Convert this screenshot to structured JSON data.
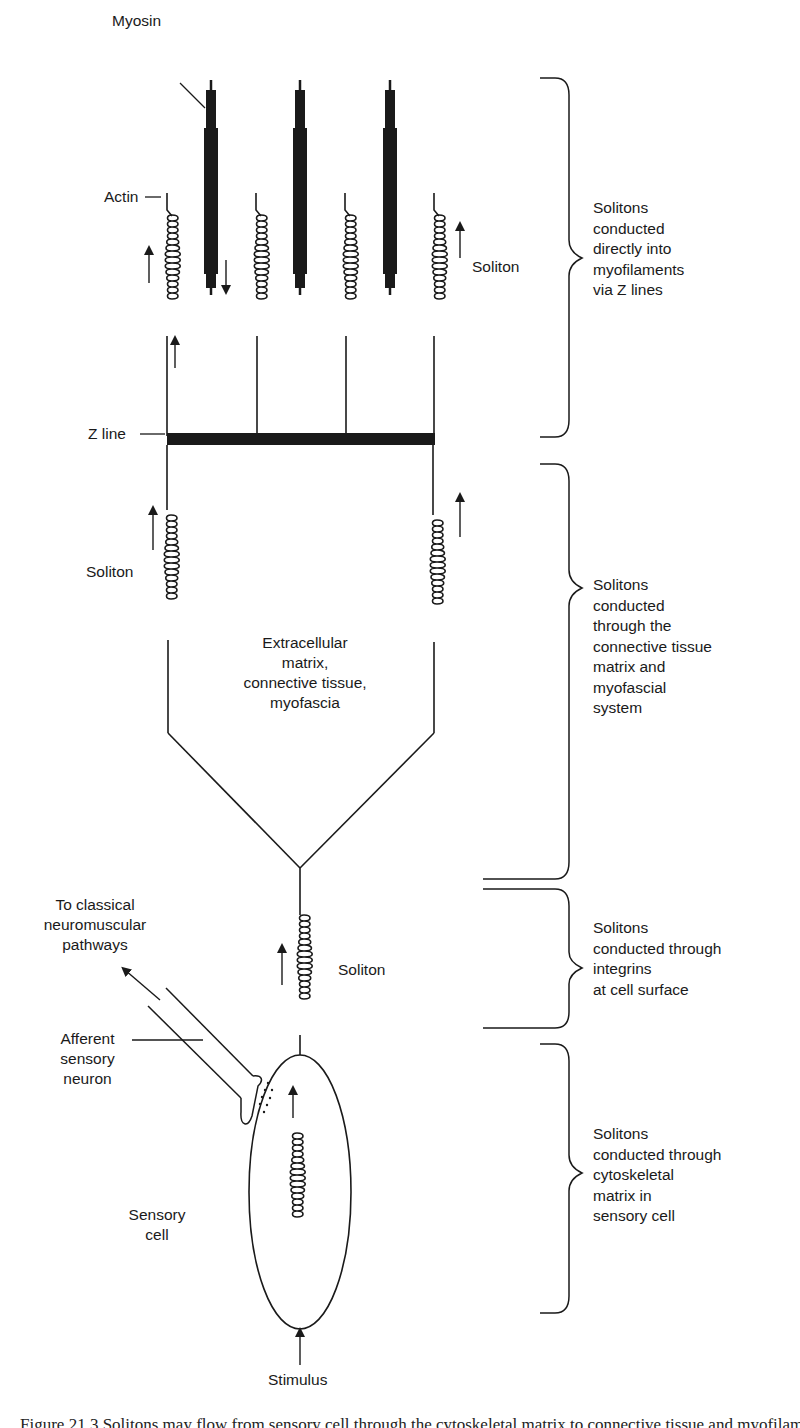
{
  "figure": {
    "labels": {
      "myosin": "Myosin",
      "actin": "Actin",
      "z_line": "Z line",
      "soliton_top": "Soliton",
      "soliton_mid": "Soliton",
      "soliton_low": "Soliton",
      "ecm_line1": "Extracellular",
      "ecm_line2": "matrix,",
      "ecm_line3": "connective tissue,",
      "ecm_line4": "myofascia",
      "to_classical_line1": "To classical",
      "to_classical_line2": "neuromuscular",
      "to_classical_line3": "pathways",
      "afferent_line1": "Afferent",
      "afferent_line2": "sensory",
      "afferent_line3": "neuron",
      "sensory_cell_line1": "Sensory",
      "sensory_cell_line2": "cell",
      "stimulus": "Stimulus"
    },
    "braces": [
      {
        "id": "myofilaments",
        "text": "Solitons\nconducted\ndirectly into\nmyofilaments\nvia Z lines"
      },
      {
        "id": "connective",
        "text": "Solitons\nconducted\nthrough the\nconnective tissue\nmatrix and\nmyofascial\nsystem"
      },
      {
        "id": "integrins",
        "text": "Solitons\nconducted through\nintegrins\nat cell surface"
      },
      {
        "id": "cytoskeletal",
        "text": "Solitons\nconducted through\ncytoskeletal\nmatrix in\nsensory cell"
      }
    ],
    "caption": "Figure 21.3 Solitons may flow from sensory cell through the cytoskeletal matrix to connective tissue and myofilaments."
  },
  "colors": {
    "ink": "#1a1a1a",
    "background": "#ffffff"
  }
}
